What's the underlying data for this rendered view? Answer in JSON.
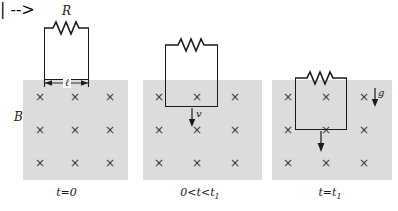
{
  "figure": {
    "width": 398,
    "height": 211,
    "background_color": "#ffffff",
    "field_fill_color": "#dcdcdc",
    "line_color": "#1a1a1a",
    "x_mark_color": "#3a3a3a"
  },
  "labels": {
    "resistance": "R",
    "field": "B",
    "length": "ℓ",
    "velocity": "v",
    "gravity": "g",
    "x_mark": "×"
  },
  "panels": [
    {
      "id": "panel-1",
      "caption_text": "t=0",
      "caption_main": "t=0",
      "caption_sub": "",
      "loop_state": "above-field",
      "shows_resistor_label": true,
      "shows_field_label": true,
      "shows_length_dimension": true,
      "shows_velocity_arrow": false,
      "shows_gravity_arrow": false,
      "x_marks_rows": 3,
      "x_marks_cols": 3
    },
    {
      "id": "panel-2",
      "caption_text": "0<t<t1",
      "caption_main": "0<t<t",
      "caption_sub": "1",
      "loop_state": "partially-entered",
      "shows_resistor_label": false,
      "shows_field_label": false,
      "shows_length_dimension": false,
      "shows_velocity_arrow": true,
      "shows_gravity_arrow": false,
      "x_marks_rows": 3,
      "x_marks_cols": 3
    },
    {
      "id": "panel-3",
      "caption_text": "t=t1",
      "caption_main": "t=t",
      "caption_sub": "1",
      "loop_state": "fully-inside",
      "shows_resistor_label": false,
      "shows_field_label": false,
      "shows_length_dimension": false,
      "shows_velocity_arrow": false,
      "shows_gravity_arrow": true,
      "x_marks_rows": 3,
      "x_marks_cols": 3
    }
  ]
}
